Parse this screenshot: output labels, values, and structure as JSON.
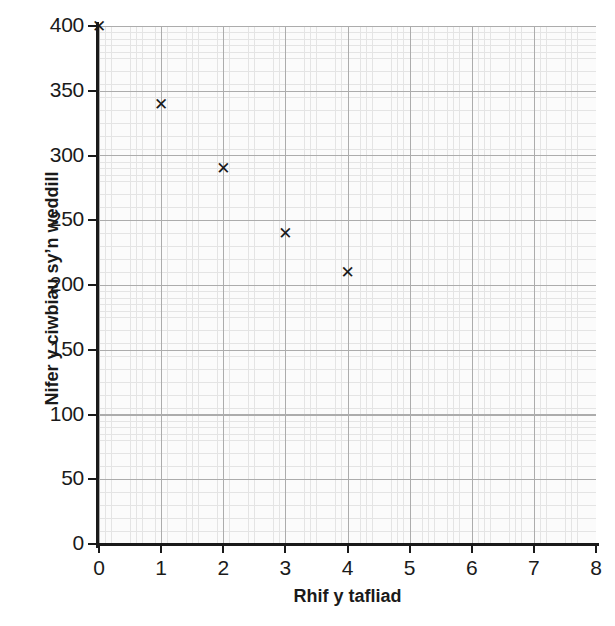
{
  "chart_data": {
    "type": "scatter",
    "title": "",
    "xlabel": "Rhif y tafliad",
    "ylabel": "Nifer y ciwbiau sy’n weddill",
    "xlim": [
      0,
      8
    ],
    "ylim": [
      0,
      400
    ],
    "grid": true,
    "grid_style": "graph-paper",
    "legend": "none",
    "marker": "x",
    "x": [
      0,
      1,
      2,
      3,
      4
    ],
    "values": [
      400,
      340,
      290,
      240,
      210
    ],
    "points": [
      {
        "x": 0,
        "y": 400
      },
      {
        "x": 1,
        "y": 340
      },
      {
        "x": 2,
        "y": 290
      },
      {
        "x": 3,
        "y": 240
      },
      {
        "x": 4,
        "y": 210
      }
    ],
    "xticks": [
      0,
      1,
      2,
      3,
      4,
      5,
      6,
      7,
      8
    ],
    "xticklabels": [
      "0",
      "1",
      "2",
      "3",
      "4",
      "5",
      "6",
      "7",
      "8"
    ],
    "yticks": [
      0,
      50,
      100,
      150,
      200,
      250,
      300,
      350,
      400
    ],
    "yticklabels": [
      "0",
      "50",
      "100",
      "150",
      "200",
      "250",
      "300",
      "350",
      "400"
    ],
    "colors": {
      "marker": "#1a1a1a",
      "axis": "#1a1a1a",
      "major_grid": "#8c8c8c",
      "minor_grid": "#dcdcdc",
      "background": "#ffffff"
    }
  },
  "artifacts": {
    "top_left_fragment": "·",
    "top_right_fragment_1": "·",
    "top_right_fragment_2": "·"
  }
}
